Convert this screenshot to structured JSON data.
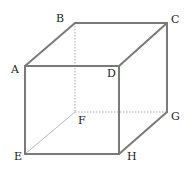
{
  "diagram": {
    "type": "cube",
    "colors": {
      "edge": "#7a7a7a",
      "hidden_edge": "#9a9a9a",
      "label": "#222222"
    },
    "vertices": {
      "A": {
        "label": "A",
        "x": 25,
        "y": 66
      },
      "B": {
        "label": "B",
        "x": 75,
        "y": 23
      },
      "C": {
        "label": "C",
        "x": 167,
        "y": 23
      },
      "D": {
        "label": "D",
        "x": 119,
        "y": 66
      },
      "E": {
        "label": "E",
        "x": 25,
        "y": 154
      },
      "F": {
        "label": "F",
        "x": 75,
        "y": 112
      },
      "G": {
        "label": "G",
        "x": 167,
        "y": 112
      },
      "H": {
        "label": "H",
        "x": 119,
        "y": 154
      }
    },
    "visible_edges": [
      "AB",
      "BC",
      "CD",
      "DA",
      "AE",
      "DH",
      "CG",
      "EH",
      "HG"
    ],
    "hidden_edges": [
      "BF",
      "EF",
      "FG"
    ]
  }
}
